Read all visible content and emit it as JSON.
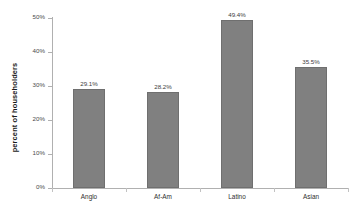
{
  "chart_data": {
    "type": "bar",
    "title": "",
    "xlabel": "",
    "ylabel": "percent of householders",
    "categories": [
      "Anglo",
      "Af-Am",
      "Latino",
      "Asian"
    ],
    "values": [
      29.1,
      28.2,
      49.4,
      35.5
    ],
    "value_labels": [
      "29.1%",
      "28.2%",
      "49.4%",
      "35.5%"
    ],
    "ylim": [
      0,
      50
    ],
    "ytick_values": [
      0,
      10,
      20,
      30,
      40,
      50
    ],
    "ytick_labels": [
      "0%",
      "10%",
      "20%",
      "30%",
      "40%",
      "50%"
    ],
    "grid": false,
    "legend": "none",
    "bar_color": "#808080",
    "bar_edge_color": "#6f6f6f",
    "axis_color": "#b0b0b0",
    "background_color": "#ffffff",
    "text_color": "#3d3d3d"
  }
}
